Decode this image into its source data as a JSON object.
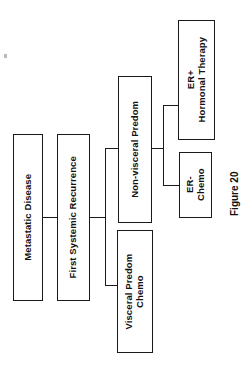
{
  "figure": {
    "caption": "Figure 20",
    "orientation": "rotated-90-ccw",
    "background_color": "#ffffff",
    "stroke_color": "#1a1a1a",
    "text_color": "#111111"
  },
  "nodes": [
    {
      "id": "metastatic",
      "label": "Metastatic Disease",
      "line1": "Metastatic Disease",
      "line2": "",
      "font_size": 9.5,
      "level": 0
    },
    {
      "id": "recurrence",
      "label": "First Systemic Recurrence",
      "line1": "First Systemic Recurrence",
      "line2": "",
      "font_size": 9.5,
      "level": 1
    },
    {
      "id": "nonvisceral",
      "label": "Non-visceral Predom",
      "line1": "Non-visceral Predom",
      "line2": "",
      "font_size": 9.5,
      "level": 2
    },
    {
      "id": "visceral",
      "label": "Visceral Predom Chemo",
      "line1": "Visceral Predom",
      "line2": "Chemo",
      "font_size": 9.5,
      "level": 2
    },
    {
      "id": "erpos",
      "label": "ER+ Hormonal Therapy",
      "line1": "ER+",
      "line2": "Hormonal Therapy",
      "font_size": 9.5,
      "level": 3
    },
    {
      "id": "erneg",
      "label": "ER- Chemo",
      "line1": "ER-",
      "line2": "Chemo",
      "font_size": 9.5,
      "level": 3
    }
  ],
  "edges": [
    {
      "from": "metastatic",
      "to": "recurrence"
    },
    {
      "from": "recurrence",
      "to": "nonvisceral"
    },
    {
      "from": "recurrence",
      "to": "visceral"
    },
    {
      "from": "nonvisceral",
      "to": "erpos"
    },
    {
      "from": "nonvisceral",
      "to": "erneg"
    }
  ]
}
